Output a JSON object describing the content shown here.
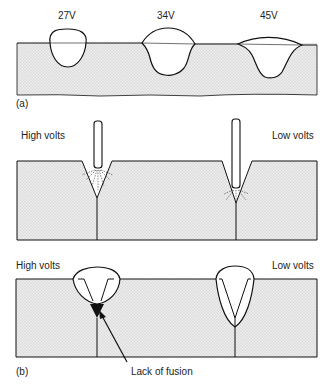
{
  "figure": {
    "panel_a": {
      "tag": "(a)",
      "beads": [
        {
          "label": "27V"
        },
        {
          "label": "34V"
        },
        {
          "label": "45V"
        }
      ]
    },
    "panel_middle": {
      "left_label": "High volts",
      "right_label": "Low volts"
    },
    "panel_b": {
      "tag": "(b)",
      "left_label": "High volts",
      "right_label": "Low volts",
      "annotation": "Lack of fusion"
    }
  },
  "colors": {
    "line": "#111111",
    "plate_fill": "#e6e6e6",
    "background": "#ffffff"
  }
}
